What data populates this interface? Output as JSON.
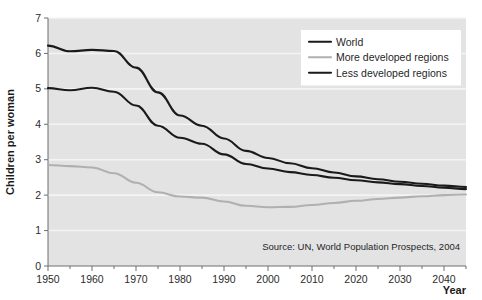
{
  "figure": {
    "background_color": "#ffffff",
    "plot_background_color": "#e3e3e3",
    "gridline_color": "#f4f4f4",
    "axis_color": "#6e6e6e"
  },
  "axes": {
    "y_title": "Children per woman",
    "x_title": "Year",
    "y_ticks": [
      "0",
      "1",
      "2",
      "3",
      "4",
      "5",
      "6",
      "7"
    ],
    "x_ticks": [
      "1950",
      "1960",
      "1970",
      "1980",
      "1990",
      "2000",
      "2010",
      "2020",
      "2030",
      "2040"
    ]
  },
  "legend": {
    "position": "top-right",
    "background_color": "#ffffff",
    "items": [
      {
        "label": "World",
        "color": "#1a1a1a"
      },
      {
        "label": "More developed regions",
        "color": "#b0b0b0"
      },
      {
        "label": "Less developed regions",
        "color": "#1a1a1a"
      }
    ]
  },
  "annotations": {
    "source": "Source: UN, World Population Prospects, 2004"
  },
  "chart_data": {
    "type": "line",
    "title": "",
    "xlabel": "Year",
    "ylabel": "Children per woman",
    "xlim": [
      1950,
      2045
    ],
    "ylim": [
      0,
      7
    ],
    "grid": true,
    "legend_position": "top-right",
    "x": [
      1950,
      1955,
      1960,
      1965,
      1970,
      1975,
      1980,
      1985,
      1990,
      1995,
      2000,
      2005,
      2010,
      2015,
      2020,
      2025,
      2030,
      2035,
      2040,
      2045
    ],
    "series": [
      {
        "name": "World",
        "color": "#1a1a1a",
        "values": [
          5.02,
          4.96,
          5.03,
          4.92,
          4.53,
          3.96,
          3.62,
          3.45,
          3.15,
          2.88,
          2.75,
          2.65,
          2.57,
          2.49,
          2.42,
          2.36,
          2.31,
          2.26,
          2.21,
          2.17
        ]
      },
      {
        "name": "More developed regions",
        "color": "#b0b0b0",
        "values": [
          2.85,
          2.82,
          2.78,
          2.62,
          2.35,
          2.08,
          1.96,
          1.93,
          1.82,
          1.7,
          1.66,
          1.67,
          1.72,
          1.78,
          1.84,
          1.89,
          1.93,
          1.97,
          2.0,
          2.02
        ]
      },
      {
        "name": "Less developed regions",
        "color": "#1a1a1a",
        "values": [
          6.22,
          6.06,
          6.1,
          6.07,
          5.6,
          4.9,
          4.25,
          3.96,
          3.6,
          3.25,
          3.05,
          2.9,
          2.76,
          2.64,
          2.53,
          2.45,
          2.38,
          2.32,
          2.27,
          2.23
        ]
      }
    ]
  }
}
